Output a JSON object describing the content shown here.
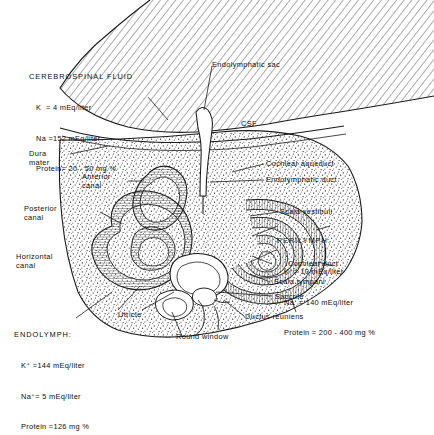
{
  "figure": {
    "background_color": "#ffffff",
    "ink_color": "#111111"
  },
  "fluid_blocks": [
    {
      "id": "cerebrospinal-fluid",
      "heading": "CEREBROSPINAL FLUID",
      "lines": [
        "K  = 4 mEq/liter",
        "Na =152 mEq/liter",
        "Protein= 20 - 50 mg %"
      ]
    },
    {
      "id": "perilymph",
      "heading": "PERILYMPH:",
      "lines": [
        "K⁺= 10 mEq/liter",
        "Na  = 140 mEq/liter",
        "Protein = 200 - 400 mg %"
      ]
    },
    {
      "id": "endolymph",
      "heading": "ENDOLYMPH:",
      "lines": [
        "K⁺ =144 mEq/liter",
        "Na⁺= 5 mEq/liter",
        "Protein =126 mg %"
      ]
    }
  ],
  "labels": [
    {
      "id": "endolymphatic-sac",
      "text": "Endolymphatic sac"
    },
    {
      "id": "csf",
      "text": "CSF"
    },
    {
      "id": "cochlear-aqueduct",
      "text": "Cochlear aqueduct"
    },
    {
      "id": "endolymphatic-duct",
      "text": "Endolymphatic duct"
    },
    {
      "id": "scala-vestibuli",
      "text": "Scala vestibuli"
    },
    {
      "id": "cochlear-duct",
      "text": "Cochlear duct"
    },
    {
      "id": "scala-tympani",
      "text": "Scala tympani"
    },
    {
      "id": "dura-mater",
      "text": "Dura\nmater"
    },
    {
      "id": "anterior-canal",
      "text": "Anterior\ncanal"
    },
    {
      "id": "posterior-canal",
      "text": "Posterior\ncanal"
    },
    {
      "id": "horizontal-canal",
      "text": "Horizontal\ncanal"
    },
    {
      "id": "utricle",
      "text": "Utricle"
    },
    {
      "id": "saccule",
      "text": "Saccule"
    },
    {
      "id": "ductus-reuniens",
      "text": "Ductus reuniens"
    },
    {
      "id": "round-window",
      "text": "Round window"
    }
  ]
}
